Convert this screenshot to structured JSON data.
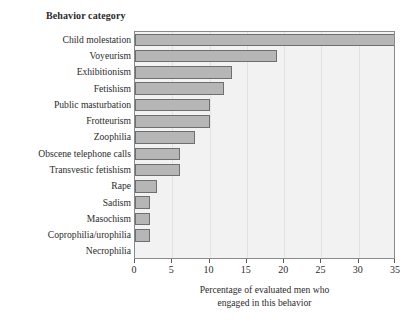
{
  "header": {
    "category_column_title": "Behavior category"
  },
  "axis": {
    "x_title_line1": "Percentage of evaluated men who",
    "x_title_line2": "engaged in this behavior",
    "ticks": [
      "0",
      "5",
      "10",
      "15",
      "20",
      "25",
      "30",
      "35"
    ]
  },
  "colors": {
    "bar_fill": "#b6b6b6",
    "bar_stroke": "#6f6f6f",
    "plot_background": "#f2f2f2",
    "plot_border": "#8a8a8a",
    "gridline": "#e2e2e2",
    "text": "#2b2b2b"
  },
  "chart_data": {
    "type": "bar",
    "orientation": "horizontal",
    "title": "",
    "xlabel": "Percentage of evaluated men who engaged in this behavior",
    "ylabel": "Behavior category",
    "xlim": [
      0,
      35
    ],
    "xticks": [
      0,
      5,
      10,
      15,
      20,
      25,
      30,
      35
    ],
    "grid": true,
    "legend": "none",
    "categories": [
      "Child molestation",
      "Voyeurism",
      "Exhibitionism",
      "Fetishism",
      "Public masturbation",
      "Frotteurism",
      "Zoophilia",
      "Obscene telephone calls",
      "Transvestic fetishism",
      "Rape",
      "Sadism",
      "Masochism",
      "Coprophilia/urophilia",
      "Necrophilia"
    ],
    "values": [
      35,
      19,
      13,
      12,
      10,
      10,
      8,
      6,
      6,
      3,
      2,
      2,
      2,
      0
    ]
  }
}
